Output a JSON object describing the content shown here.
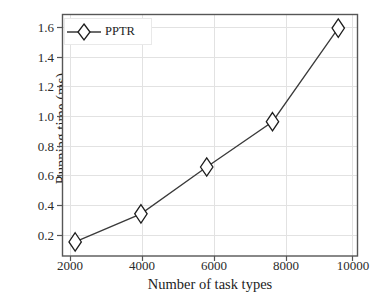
{
  "chart_data": {
    "type": "line",
    "title": "",
    "xlabel": "Number of task types",
    "ylabel": "Running time (ms)",
    "x": [
      2000,
      4000,
      6000,
      8000,
      10000
    ],
    "xtick_labels": [
      "2000",
      "4000",
      "6000",
      "8000",
      "10000"
    ],
    "ytick_labels": [
      "0.2",
      "0.4",
      "0.6",
      "0.8",
      "1.0",
      "1.2",
      "1.4",
      "1.6"
    ],
    "ytick_values": [
      0.2,
      0.4,
      0.6,
      0.8,
      1.0,
      1.2,
      1.4,
      1.6
    ],
    "xlim": [
      1600,
      10600
    ],
    "ylim": [
      0.13,
      1.68
    ],
    "grid": true,
    "legend_position": "upper left",
    "series": [
      {
        "name": "PPTR",
        "marker": "diamond",
        "color": "#3a3a3a",
        "values": [
          0.22,
          0.4,
          0.7,
          0.99,
          1.59
        ]
      }
    ]
  },
  "legend": {
    "entries": [
      {
        "label": "PPTR",
        "marker": "diamond-marker-icon"
      }
    ]
  },
  "colors": {
    "line": "#3a3a3a",
    "marker_edge": "#1d1d1d",
    "marker_face": "#ffffff",
    "grid": "#e2e2e2",
    "axis": "#555555",
    "background": "#ffffff",
    "text": "#1d1d1d"
  }
}
